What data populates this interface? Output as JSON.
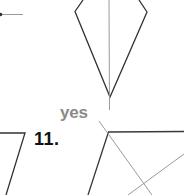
{
  "colors": {
    "figure_stroke": "#333333",
    "symmetry_line": "#9a9a9a",
    "answer_text": "#8a8a8a",
    "problem_number_text": "#111111",
    "background": "#ffffff"
  },
  "exercise_10": {
    "figure": "kite",
    "has_line_of_symmetry_drawn": true,
    "answer": "yes"
  },
  "exercise_11": {
    "number": "11.",
    "figure": "parallelogram",
    "lines_drawn": 2
  },
  "left_partial_figure": {
    "figure": "segment-with-point"
  }
}
